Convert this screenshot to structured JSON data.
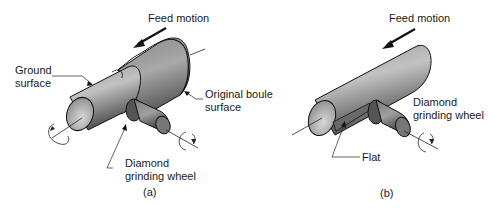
{
  "figure_a": {
    "caption": "(a)",
    "labels": {
      "feed_motion": "Feed motion",
      "ground_surface_line1": "Ground",
      "ground_surface_line2": "surface",
      "original_boule_line1": "Original boule",
      "original_boule_line2": "surface",
      "diamond_wheel_line1": "Diamond",
      "diamond_wheel_line2": "grinding wheel"
    }
  },
  "figure_b": {
    "caption": "(b)",
    "labels": {
      "feed_motion": "Feed motion",
      "diamond_wheel_line1": "Diamond",
      "diamond_wheel_line2": "grinding wheel",
      "flat": "Flat"
    }
  },
  "colors": {
    "cylinder_dark": "#5a5a5a",
    "cylinder_light": "#b5b5b5",
    "outline": "#111111",
    "text": "#1a1a1a"
  }
}
